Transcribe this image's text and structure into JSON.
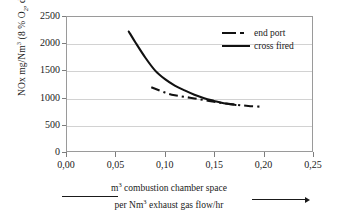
{
  "chart_data": {
    "type": "line",
    "title": "",
    "xlabel": "m3 combustion chamber space per Nm3 exhaust gas flow/hr",
    "ylabel": "NOx mg/Nm3 (8 % O2, dry)",
    "xlim": [
      0.0,
      0.25
    ],
    "ylim": [
      0,
      2500
    ],
    "xticks": [
      "0,00",
      "0,05",
      "0,10",
      "0,15",
      "0,20",
      "0,25"
    ],
    "xtick_values": [
      0.0,
      0.05,
      0.1,
      0.15,
      0.2,
      0.25
    ],
    "yticks": [
      "0",
      "500",
      "1000",
      "1500",
      "2000",
      "2500"
    ],
    "ytick_values": [
      0,
      500,
      1000,
      1500,
      2000,
      2500
    ],
    "grid": "horizontal",
    "legend_position": "top-right",
    "series": [
      {
        "name": "end port",
        "style": "dash-dot",
        "x": [
          0.086,
          0.1,
          0.11,
          0.12,
          0.13,
          0.14,
          0.15,
          0.16,
          0.172,
          0.185,
          0.2
        ],
        "values": [
          1190,
          1090,
          1040,
          1010,
          980,
          950,
          920,
          890,
          865,
          840,
          825
        ]
      },
      {
        "name": "cross fired",
        "style": "solid",
        "x": [
          0.063,
          0.07,
          0.08,
          0.09,
          0.1,
          0.11,
          0.12,
          0.13,
          0.14,
          0.15,
          0.16,
          0.172
        ],
        "values": [
          2230,
          2020,
          1740,
          1500,
          1340,
          1220,
          1130,
          1050,
          985,
          935,
          890,
          860
        ]
      }
    ]
  },
  "axes": {
    "y_title_text": "NOx mg/Nm",
    "y_title_sup": "3",
    "y_title_tail": "  (8 % O",
    "y_title_sub": "2",
    "y_title_end": ", dry)",
    "x_title_line1_pre": "m",
    "x_title_line1_sup": "3",
    "x_title_line1_post": " combustion chamber space",
    "x_title_line2_pre": "per Nm",
    "x_title_line2_sup": "3",
    "x_title_line2_post": " exhaust gas flow/hr"
  },
  "legend": {
    "items": [
      {
        "label": "end port",
        "style": "dash-dot"
      },
      {
        "label": "cross fired",
        "style": "solid"
      }
    ]
  },
  "colors": {
    "curve": "#111111",
    "grid": "#d2d2d2",
    "frame": "#9a9a9a",
    "text": "#1a1a1a",
    "background": "#ffffff"
  }
}
